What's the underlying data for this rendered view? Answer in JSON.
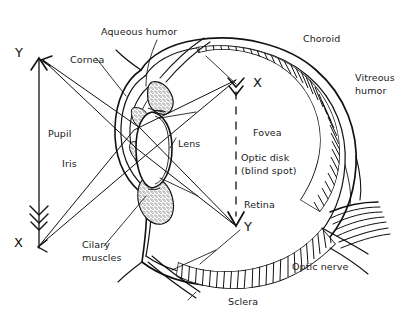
{
  "figure": {
    "type": "anatomical-diagram",
    "background_color": "#ffffff",
    "ink_color": "#111111"
  },
  "labels": {
    "aqueous_humor": "Aqueous humor",
    "cornea": "Cornea",
    "choroid": "Choroid",
    "vitreous_humor_line1": "Vitreous",
    "vitreous_humor_line2": "humor",
    "pupil": "Pupil",
    "iris": "Iris",
    "lens": "Lens",
    "fovea": "Fovea",
    "optic_disk_line1": "Optic disk",
    "optic_disk_line2": "(blind spot)",
    "retina": "Retina",
    "cilary_muscles_line1": "Cilary",
    "cilary_muscles_line2": "muscles",
    "optic_nerve": "Optic nerve",
    "sclera": "Sclera"
  },
  "ray_markers": {
    "object_top": "Y",
    "object_bottom": "X",
    "image_top": "X",
    "image_bottom": "Y"
  }
}
